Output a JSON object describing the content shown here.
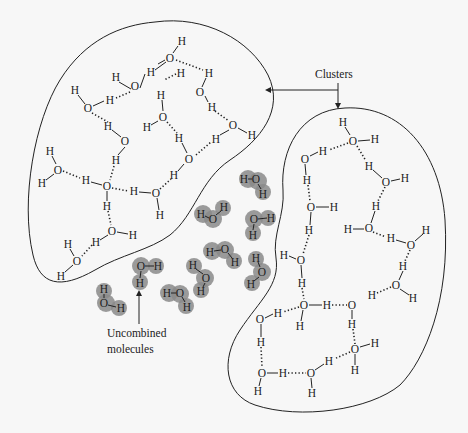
{
  "labels": {
    "clusters": "Clusters",
    "uncombined_line1": "Uncombined",
    "uncombined_line2": "molecules"
  },
  "symbols": {
    "oxygen": "O",
    "hydrogen": "H"
  },
  "colors": {
    "background": "#f7f7f7",
    "ink": "#222222",
    "free_molecule_halo": "#8a8a8a"
  },
  "cluster_left": {
    "atoms": [
      {
        "e": "H",
        "x": 182,
        "y": 41
      },
      {
        "e": "O",
        "x": 170,
        "y": 58
      },
      {
        "e": "H",
        "x": 151,
        "y": 72
      },
      {
        "e": "H",
        "x": 181,
        "y": 73
      },
      {
        "e": "H",
        "x": 116,
        "y": 77
      },
      {
        "e": "O",
        "x": 135,
        "y": 86
      },
      {
        "e": "H",
        "x": 209,
        "y": 73
      },
      {
        "e": "O",
        "x": 200,
        "y": 92
      },
      {
        "e": "H",
        "x": 75,
        "y": 90
      },
      {
        "e": "O",
        "x": 88,
        "y": 108
      },
      {
        "e": "H",
        "x": 110,
        "y": 100
      },
      {
        "e": "H",
        "x": 161,
        "y": 95
      },
      {
        "e": "O",
        "x": 163,
        "y": 117
      },
      {
        "e": "H",
        "x": 147,
        "y": 127
      },
      {
        "e": "H",
        "x": 212,
        "y": 107
      },
      {
        "e": "O",
        "x": 233,
        "y": 125
      },
      {
        "e": "H",
        "x": 216,
        "y": 139
      },
      {
        "e": "H",
        "x": 252,
        "y": 135
      },
      {
        "e": "H",
        "x": 108,
        "y": 126
      },
      {
        "e": "O",
        "x": 125,
        "y": 141
      },
      {
        "e": "H",
        "x": 116,
        "y": 160
      },
      {
        "e": "H",
        "x": 179,
        "y": 138
      },
      {
        "e": "O",
        "x": 189,
        "y": 159
      },
      {
        "e": "H",
        "x": 174,
        "y": 175
      },
      {
        "e": "H",
        "x": 50,
        "y": 151
      },
      {
        "e": "O",
        "x": 58,
        "y": 170
      },
      {
        "e": "H",
        "x": 42,
        "y": 183
      },
      {
        "e": "H",
        "x": 86,
        "y": 180
      },
      {
        "e": "O",
        "x": 107,
        "y": 186
      },
      {
        "e": "H",
        "x": 107,
        "y": 206
      },
      {
        "e": "H",
        "x": 134,
        "y": 191
      },
      {
        "e": "O",
        "x": 156,
        "y": 193
      },
      {
        "e": "H",
        "x": 160,
        "y": 215
      },
      {
        "e": "O",
        "x": 112,
        "y": 231
      },
      {
        "e": "H",
        "x": 133,
        "y": 235
      },
      {
        "e": "H",
        "x": 96,
        "y": 242
      },
      {
        "e": "H",
        "x": 68,
        "y": 244
      },
      {
        "e": "O",
        "x": 77,
        "y": 261
      },
      {
        "e": "H",
        "x": 61,
        "y": 276
      }
    ]
  },
  "cluster_right": {
    "atoms": [
      {
        "e": "H",
        "x": 343,
        "y": 122
      },
      {
        "e": "O",
        "x": 353,
        "y": 141
      },
      {
        "e": "H",
        "x": 375,
        "y": 139
      },
      {
        "e": "H",
        "x": 323,
        "y": 151
      },
      {
        "e": "O",
        "x": 305,
        "y": 159
      },
      {
        "e": "H",
        "x": 307,
        "y": 180
      },
      {
        "e": "H",
        "x": 369,
        "y": 166
      },
      {
        "e": "O",
        "x": 386,
        "y": 182
      },
      {
        "e": "H",
        "x": 405,
        "y": 178
      },
      {
        "e": "O",
        "x": 311,
        "y": 207
      },
      {
        "e": "H",
        "x": 334,
        "y": 207
      },
      {
        "e": "H",
        "x": 376,
        "y": 206
      },
      {
        "e": "H",
        "x": 309,
        "y": 230
      },
      {
        "e": "O",
        "x": 369,
        "y": 228
      },
      {
        "e": "H",
        "x": 348,
        "y": 229
      },
      {
        "e": "H",
        "x": 391,
        "y": 238
      },
      {
        "e": "H",
        "x": 426,
        "y": 230
      },
      {
        "e": "O",
        "x": 411,
        "y": 245
      },
      {
        "e": "H",
        "x": 284,
        "y": 255
      },
      {
        "e": "O",
        "x": 301,
        "y": 260
      },
      {
        "e": "H",
        "x": 403,
        "y": 266
      },
      {
        "e": "H",
        "x": 302,
        "y": 283
      },
      {
        "e": "O",
        "x": 396,
        "y": 285
      },
      {
        "e": "H",
        "x": 413,
        "y": 298
      },
      {
        "e": "H",
        "x": 372,
        "y": 295
      },
      {
        "e": "O",
        "x": 304,
        "y": 305
      },
      {
        "e": "H",
        "x": 327,
        "y": 305
      },
      {
        "e": "O",
        "x": 352,
        "y": 305
      },
      {
        "e": "H",
        "x": 300,
        "y": 326
      },
      {
        "e": "H",
        "x": 352,
        "y": 324
      },
      {
        "e": "H",
        "x": 278,
        "y": 313
      },
      {
        "e": "O",
        "x": 260,
        "y": 319
      },
      {
        "e": "H",
        "x": 261,
        "y": 342
      },
      {
        "e": "H",
        "x": 375,
        "y": 343
      },
      {
        "e": "O",
        "x": 355,
        "y": 349
      },
      {
        "e": "H",
        "x": 355,
        "y": 370
      },
      {
        "e": "H",
        "x": 329,
        "y": 361
      },
      {
        "e": "O",
        "x": 311,
        "y": 373
      },
      {
        "e": "H",
        "x": 312,
        "y": 393
      },
      {
        "e": "O",
        "x": 262,
        "y": 373
      },
      {
        "e": "H",
        "x": 283,
        "y": 373
      },
      {
        "e": "H",
        "x": 258,
        "y": 391
      }
    ]
  },
  "free_molecules": [
    {
      "atoms": [
        {
          "e": "H",
          "x": 244,
          "y": 179
        },
        {
          "e": "O",
          "x": 256,
          "y": 179
        },
        {
          "e": "H",
          "x": 263,
          "y": 194
        }
      ]
    },
    {
      "atoms": [
        {
          "e": "H",
          "x": 201,
          "y": 214
        },
        {
          "e": "O",
          "x": 213,
          "y": 219
        },
        {
          "e": "H",
          "x": 224,
          "y": 207
        }
      ]
    },
    {
      "atoms": [
        {
          "e": "O",
          "x": 254,
          "y": 219
        },
        {
          "e": "H",
          "x": 271,
          "y": 218
        },
        {
          "e": "H",
          "x": 253,
          "y": 235
        }
      ]
    },
    {
      "atoms": [
        {
          "e": "H",
          "x": 210,
          "y": 252
        },
        {
          "e": "O",
          "x": 225,
          "y": 249
        },
        {
          "e": "H",
          "x": 235,
          "y": 262
        }
      ]
    },
    {
      "atoms": [
        {
          "e": "H",
          "x": 256,
          "y": 258
        },
        {
          "e": "O",
          "x": 262,
          "y": 272
        },
        {
          "e": "H",
          "x": 251,
          "y": 284
        }
      ]
    },
    {
      "atoms": [
        {
          "e": "H",
          "x": 193,
          "y": 265
        },
        {
          "e": "O",
          "x": 206,
          "y": 278
        },
        {
          "e": "H",
          "x": 201,
          "y": 291
        }
      ]
    },
    {
      "atoms": [
        {
          "e": "O",
          "x": 141,
          "y": 266
        },
        {
          "e": "H",
          "x": 158,
          "y": 266
        },
        {
          "e": "H",
          "x": 140,
          "y": 283
        }
      ]
    },
    {
      "atoms": [
        {
          "e": "H",
          "x": 167,
          "y": 293
        },
        {
          "e": "O",
          "x": 180,
          "y": 293
        },
        {
          "e": "H",
          "x": 187,
          "y": 307
        }
      ]
    },
    {
      "atoms": [
        {
          "e": "H",
          "x": 104,
          "y": 289
        },
        {
          "e": "O",
          "x": 104,
          "y": 303
        },
        {
          "e": "H",
          "x": 121,
          "y": 308
        }
      ]
    }
  ]
}
